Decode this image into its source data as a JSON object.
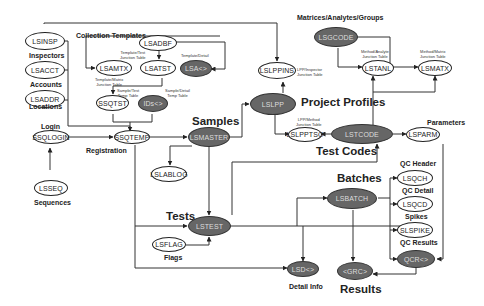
{
  "diagram": {
    "nodes": {
      "lsinsp": "LSINSP",
      "lsacct": "LSACCT",
      "lsaddr": "LSADDR",
      "ssqlogin": "SSQLOGIN",
      "lsseq": "LSSEQ",
      "lsadbf": "LSADBF",
      "lsamtx": "LSAMTX",
      "lsatst": "LSATST",
      "lsa_detail": "LSA<>",
      "ssqtst": "SSQTST",
      "ids": "IDs<>",
      "ssqtemp": "SSQTEMP",
      "lsmaster": "LSMASTER",
      "lslablog": "LSLABLOG",
      "lsppins": "LSLPPINS",
      "lslpp": "LSLPP",
      "lslpptso": "LSLPPTSO",
      "lsgcode": "LSGCODE",
      "lstanl": "LSTANL",
      "lsmatx": "LSMATX",
      "lstcode": "LSTCODE",
      "lsparm": "LSPARM",
      "lsqch": "LSQCH",
      "lsqcd": "LSQCD",
      "slspike": "SLSPIKE",
      "qcr": "QCR<>",
      "lsbatch": "LSBATCH",
      "lstest": "LSTEST",
      "lsflag": "LSFLAG",
      "lsd": "LSD<>",
      "grc": "<GRC>"
    },
    "labels": {
      "inspectors": "Inspectors",
      "accounts": "Accounts",
      "locations": "Locations",
      "login": "Login",
      "sequences": "Sequences",
      "collection_templates": "Collection Templates",
      "registration": "Registration",
      "samples": "Samples",
      "project_profiles": "Project Profiles",
      "matrices": "Matrices/Analytes/Groups",
      "test_codes": "Test Codes",
      "parameters": "Parameters",
      "qc_header": "QC Header",
      "qc_detail": "QC Detail",
      "spikes": "Spikes",
      "qc_results": "QC Results",
      "batches": "Batches",
      "tests": "Tests",
      "flags": "Flags",
      "detail_info": "Detail Info",
      "results": "Results"
    },
    "notes": {
      "template_test_1": "Template/Test",
      "template_test_2": "Junction Table",
      "template_matrix_1": "Template/Matrix",
      "template_matrix_2": "Junction Table",
      "template_detail": "Template/Detail",
      "sample_test_1": "Sample/Test",
      "sample_test_2": "Temp Table",
      "sample_detail_1": "Sample/Detail",
      "sample_detail_2": "Temp Table",
      "lpp_inspector_1": "LPP/Inspector",
      "lpp_inspector_2": "Junction Table",
      "lpp_method_1": "LPP/Method",
      "lpp_method_2": "Junction Table",
      "method_analyte_1": "Method/Analyte",
      "method_analyte_2": "Junction Table",
      "method_matrix_1": "Method/Matrix",
      "method_matrix_2": "Junction Table"
    }
  }
}
